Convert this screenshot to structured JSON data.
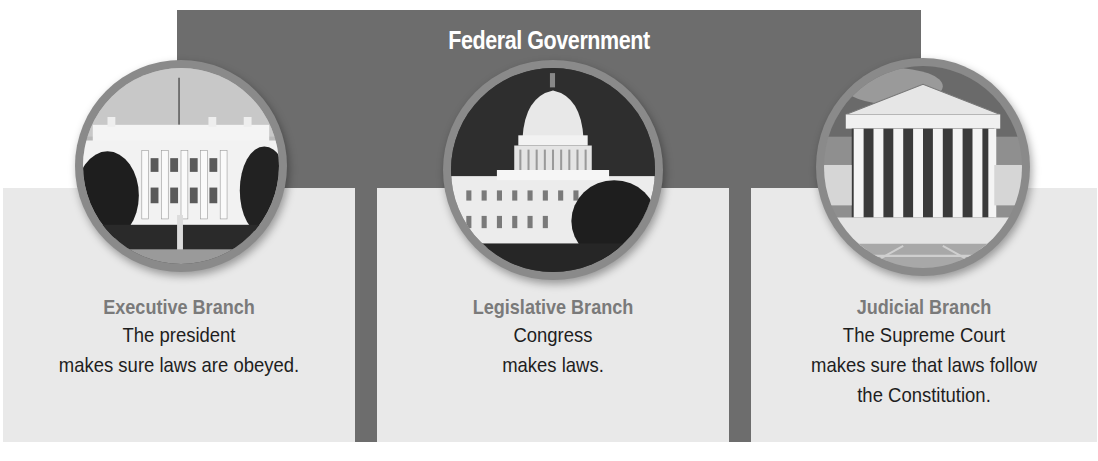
{
  "header": {
    "title": "Federal Government"
  },
  "branches": [
    {
      "name": "Executive Branch",
      "desc_line1": "The president",
      "desc_line2": "makes sure laws are obeyed.",
      "desc_line3": "",
      "image": "white-house-photo"
    },
    {
      "name": "Legislative Branch",
      "desc_line1": "Congress",
      "desc_line2": "makes laws.",
      "desc_line3": "",
      "image": "capitol-building-photo"
    },
    {
      "name": "Judicial Branch",
      "desc_line1": "The Supreme Court",
      "desc_line2": "makes sure that laws follow",
      "desc_line3": "the Constitution.",
      "image": "supreme-court-photo"
    }
  ],
  "colors": {
    "banner": "#6d6d6d",
    "panel": "#e9e9e9",
    "branch_title": "#7a7a7a",
    "text": "#1e1e1e"
  }
}
